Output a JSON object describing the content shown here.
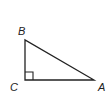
{
  "diagram": {
    "type": "right-triangle",
    "vertices": [
      {
        "name": "B",
        "x": 25,
        "y": 40,
        "label_x": 18,
        "label_y": 35
      },
      {
        "name": "C",
        "x": 25,
        "y": 80,
        "label_x": 10,
        "label_y": 91
      },
      {
        "name": "A",
        "x": 94,
        "y": 80,
        "label_x": 98,
        "label_y": 91
      }
    ],
    "right_angle_at": "C",
    "labels": {
      "B": "B",
      "C": "C",
      "A": "A"
    },
    "colors": {
      "stroke": "#222222",
      "background": "#ffffff"
    }
  }
}
